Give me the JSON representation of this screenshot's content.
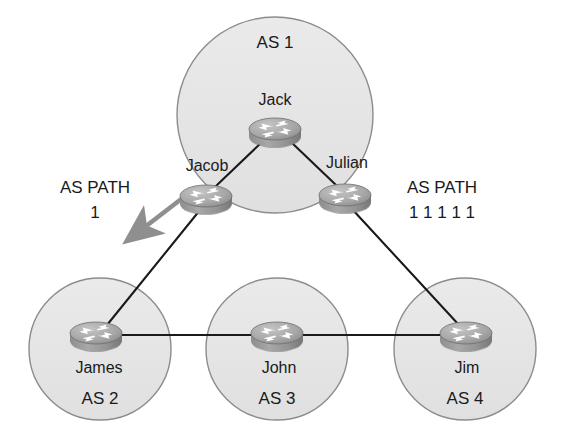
{
  "diagram": {
    "type": "network-topology",
    "colors": {
      "cloud_fill": "#e6e6e6",
      "cloud_stroke": "#8c8c8c",
      "link_stroke": "#1a1a1a",
      "arrow_fill": "#8f8f8f",
      "router_body": "#9a9a9a",
      "router_top": "#b5b5b5",
      "router_symbol": "#ffffff",
      "text": "#1a1a1a",
      "background": "#ffffff"
    },
    "domains": [
      {
        "id": "as1",
        "label": "AS 1",
        "cx": 275,
        "cy": 115,
        "r": 98,
        "label_x": 275,
        "label_y": 44
      },
      {
        "id": "as2",
        "label": "AS 2",
        "cx": 100,
        "cy": 349,
        "r": 71,
        "label_x": 100,
        "label_y": 400
      },
      {
        "id": "as3",
        "label": "AS 3",
        "cx": 277,
        "cy": 349,
        "r": 71,
        "label_x": 277,
        "label_y": 400
      },
      {
        "id": "as4",
        "label": "AS 4",
        "cx": 465,
        "cy": 349,
        "r": 71,
        "label_x": 465,
        "label_y": 400
      }
    ],
    "routers": [
      {
        "id": "jack",
        "label": "Jack",
        "cx": 275,
        "cy": 130,
        "label_x": 275,
        "label_y": 101,
        "domain": "as1"
      },
      {
        "id": "jacob",
        "label": "Jacob",
        "cx": 206,
        "cy": 197,
        "label_x": 207,
        "label_y": 167,
        "domain": "as1"
      },
      {
        "id": "julian",
        "label": "Julian",
        "cx": 345,
        "cy": 196,
        "label_x": 347,
        "label_y": 164,
        "domain": "as1"
      },
      {
        "id": "james",
        "label": "James",
        "cx": 96,
        "cy": 334,
        "label_x": 99,
        "label_y": 369,
        "domain": "as2"
      },
      {
        "id": "john",
        "label": "John",
        "cx": 277,
        "cy": 334,
        "label_x": 279,
        "label_y": 369,
        "domain": "as3"
      },
      {
        "id": "jim",
        "label": "Jim",
        "cx": 466,
        "cy": 334,
        "label_x": 467,
        "label_y": 369,
        "domain": "as4"
      }
    ],
    "links": [
      {
        "id": "jack-jacob",
        "from": "jack",
        "to": "jacob",
        "x1": 262,
        "y1": 142,
        "x2": 216,
        "y2": 186
      },
      {
        "id": "jack-julian",
        "from": "jack",
        "to": "julian",
        "x1": 291,
        "y1": 142,
        "x2": 336,
        "y2": 185
      },
      {
        "id": "jacob-james",
        "from": "jacob",
        "to": "james",
        "x1": 200,
        "y1": 210,
        "x2": 107,
        "y2": 325
      },
      {
        "id": "julian-jim",
        "from": "julian",
        "to": "jim",
        "x1": 352,
        "y1": 209,
        "x2": 459,
        "y2": 325
      },
      {
        "id": "james-john",
        "from": "james",
        "to": "john",
        "x1": 110,
        "y1": 335,
        "x2": 264,
        "y2": 335
      },
      {
        "id": "john-jim",
        "from": "john",
        "to": "jim",
        "x1": 292,
        "y1": 335,
        "x2": 452,
        "y2": 335
      }
    ],
    "arrows": [
      {
        "id": "as-path-arrow",
        "x1": 193,
        "y1": 190,
        "x2": 124,
        "y2": 244
      }
    ],
    "annotations": [
      {
        "id": "as-path-left",
        "title": "AS PATH",
        "value": "1",
        "title_x": 95,
        "title_y": 189,
        "value_x": 95,
        "value_y": 214
      },
      {
        "id": "as-path-right",
        "title": "AS PATH",
        "value": "1 1 1 1 1",
        "title_x": 442,
        "title_y": 189,
        "value_x": 442,
        "value_y": 214
      }
    ]
  }
}
